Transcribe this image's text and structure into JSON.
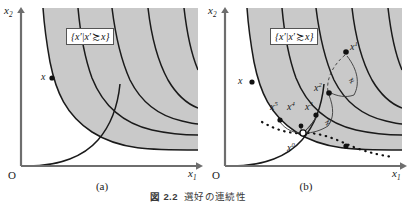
{
  "figure": {
    "caption_number": "図 2.2",
    "caption_text": "選好の連続性",
    "axis_x": "x",
    "axis_x_sub": "1",
    "axis_y": "x",
    "axis_y_sub": "2",
    "origin": "O"
  },
  "panels": [
    {
      "id": "a",
      "subcaption": "(a)",
      "set_label": {
        "open": "{",
        "var1": "x",
        "prime1": "′",
        "bar": "|",
        "var2": "x",
        "prime2": "′",
        "relation": "≿",
        "var3": "x",
        "close": "}"
      },
      "points": [
        {
          "name": "x",
          "label": "x",
          "superscript": "",
          "style": "filled",
          "x": 52,
          "y": 78
        }
      ],
      "indifference_curves": 6,
      "shaded_region_color": "#c9c9c9",
      "curve_color": "#1a1a1a",
      "axis_color": "#6e6e6e"
    },
    {
      "id": "b",
      "subcaption": "(b)",
      "set_label": {
        "open": "{",
        "var1": "x",
        "prime1": "′",
        "bar": "|",
        "var2": "x",
        "prime2": "′",
        "relation": "≿",
        "var3": "x",
        "close": "}"
      },
      "points": [
        {
          "name": "x",
          "label": "x",
          "superscript": "",
          "style": "filled",
          "x": 48,
          "y": 82
        },
        {
          "name": "x1",
          "label": "x",
          "superscript": "1",
          "style": "filled",
          "x": 142,
          "y": 52
        },
        {
          "name": "x2",
          "label": "x",
          "superscript": "2",
          "style": "filled",
          "x": 125,
          "y": 93
        },
        {
          "name": "x3",
          "label": "x",
          "superscript": "3",
          "style": "filled",
          "x": 112,
          "y": 115
        },
        {
          "name": "x4",
          "label": "x",
          "superscript": "4",
          "style": "filled",
          "x": 97,
          "y": 126
        },
        {
          "name": "x5",
          "label": "x",
          "superscript": "5",
          "style": "filled",
          "x": 76,
          "y": 120
        },
        {
          "name": "x0",
          "label": "x",
          "superscript": "0",
          "style": "open",
          "x": 99,
          "y": 133
        },
        {
          "name": "boundary-pt",
          "label": "",
          "superscript": "",
          "style": "filled",
          "x": 142,
          "y": 146
        }
      ],
      "not_equal_marks": [
        {
          "name": "ne-upper",
          "symbol": "≠",
          "x": 148,
          "y": 82
        },
        {
          "name": "ne-lower",
          "symbol": "≠",
          "x": 124,
          "y": 124
        }
      ],
      "indifference_curves": 6,
      "shaded_region_color": "#c9c9c9",
      "curve_color": "#1a1a1a",
      "axis_color": "#6e6e6e",
      "dotted_boundary_color": "#111111"
    }
  ]
}
